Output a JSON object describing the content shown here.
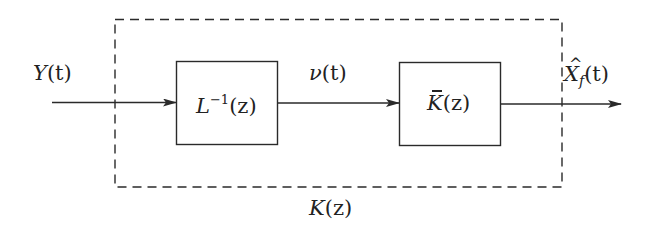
{
  "diagram": {
    "type": "block-diagram",
    "stroke_color": "#2a2a2a",
    "input_signal": {
      "symbol": "Y",
      "arg": "(t)"
    },
    "intermediate_signal": {
      "symbol": "ν",
      "arg": "(t)"
    },
    "output_signal": {
      "symbol": "X",
      "accent": "hat",
      "subscript": "f",
      "arg": "(t)"
    },
    "blocks": [
      {
        "id": "l-inverse",
        "symbol": "L",
        "superscript": "−1",
        "arg": "(z)"
      },
      {
        "id": "k-bar",
        "symbol": "K",
        "accent": "bar",
        "arg": "(z)"
      }
    ],
    "group": {
      "label_symbol": "K",
      "label_arg": "(z)",
      "style": "dashed"
    }
  }
}
